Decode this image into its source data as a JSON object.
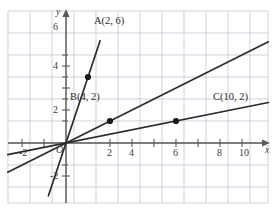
{
  "figure": {
    "kind": "coordinate-plane-graph",
    "background_color": "#ffffff",
    "grid_color": "#b9bfd0",
    "axis_color": "#5a5a5a",
    "line_color": "#2b2b2b",
    "point_color": "#1a1a1a"
  },
  "axes": {
    "x_axis_name": "x",
    "y_axis_name": "y",
    "origin_label": "O",
    "x_tick_labels": [
      "-2",
      "2",
      "4",
      "6",
      "8",
      "10"
    ],
    "y_tick_labels": [
      "6",
      "4",
      "2",
      "-2"
    ]
  },
  "chart_data": {
    "type": "line",
    "title": "",
    "xlabel": "x",
    "ylabel": "y",
    "xlim": [
      -5.3,
      18.4
    ],
    "ylim": [
      -5.5,
      13.1
    ],
    "grid": true,
    "grid_step": 2,
    "legend": "none",
    "series": [
      {
        "name": "line-through-A",
        "slope": 3,
        "intercept": 0,
        "equation": "y = 3x",
        "x_start": -1.6,
        "x_end": 3.1,
        "points": [
          {
            "label": "A(2, 6)",
            "x": 2,
            "y": 6
          }
        ]
      },
      {
        "name": "line-through-B",
        "slope": 0.5,
        "intercept": 0,
        "equation": "y = x/2",
        "x_start": -5.3,
        "x_end": 18.4,
        "points": [
          {
            "label": "B(4, 2)",
            "x": 4,
            "y": 2
          }
        ]
      },
      {
        "name": "line-through-C",
        "slope": 0.2,
        "intercept": 0,
        "equation": "y = x/5",
        "x_start": -5.3,
        "x_end": 18.4,
        "points": [
          {
            "label": "C(10, 2)",
            "x": 10,
            "y": 2
          }
        ]
      }
    ],
    "annotations": [
      {
        "text": "A(2, 6)",
        "x": 2,
        "y": 6
      },
      {
        "text": "B(4, 2)",
        "x": 4,
        "y": 2
      },
      {
        "text": "C(10, 2)",
        "x": 10,
        "y": 2
      }
    ]
  },
  "labels": {
    "point_a": "A(2, 6)",
    "point_b": "B(4, 2)",
    "point_c": "C(10, 2)",
    "x_axis": "x",
    "y_axis": "y",
    "origin": "O",
    "x_neg2": "-2",
    "x_2": "2",
    "x_4": "4",
    "x_6": "6",
    "x_8": "8",
    "x_10": "10",
    "y_6": "6",
    "y_4": "4",
    "y_2": "2",
    "y_neg2": "-2"
  }
}
